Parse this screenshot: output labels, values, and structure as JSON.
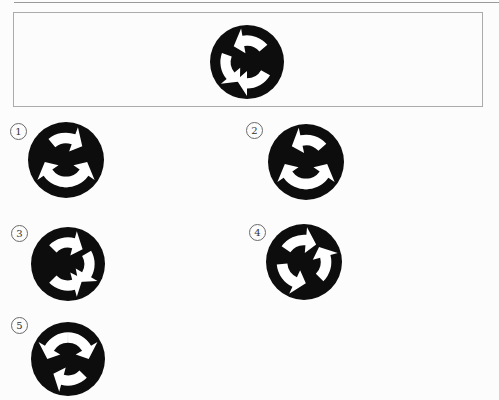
{
  "page": {
    "background": "#fcfcfc",
    "top_rule_color": "#9a9a9a",
    "question_box_border": "#ababab"
  },
  "figure_style": {
    "disc_color": "#0d0d0d",
    "arrow_color": "#ffffff"
  },
  "question": {
    "figure": {
      "diameter": 74,
      "arrows": [
        {
          "position": "top",
          "direction": "counterclockwise",
          "rotation": 10,
          "flipped": false
        },
        {
          "position": "left",
          "direction": "counterclockwise",
          "rotation": -110,
          "flipped": false
        },
        {
          "position": "bottom",
          "direction": "clockwise",
          "rotation": 160,
          "flipped": true
        }
      ]
    }
  },
  "options": [
    {
      "label": "1",
      "figure": {
        "diameter": 76,
        "arrows": [
          {
            "position": "top",
            "direction": "clockwise",
            "rotation": 0,
            "flipped": true
          },
          {
            "position": "bottom-left",
            "direction": "clockwise",
            "rotation": -145,
            "flipped": true
          },
          {
            "position": "bottom-right",
            "direction": "counterclockwise",
            "rotation": 145,
            "flipped": false
          }
        ]
      }
    },
    {
      "label": "2",
      "figure": {
        "diameter": 76,
        "arrows": [
          {
            "position": "top",
            "direction": "counterclockwise",
            "rotation": 8,
            "flipped": false
          },
          {
            "position": "bottom-left",
            "direction": "clockwise",
            "rotation": -145,
            "flipped": true
          },
          {
            "position": "bottom-right",
            "direction": "counterclockwise",
            "rotation": 145,
            "flipped": false
          }
        ]
      }
    },
    {
      "label": "3",
      "figure": {
        "diameter": 74,
        "arrows": [
          {
            "position": "top",
            "direction": "clockwise",
            "rotation": -5,
            "flipped": true
          },
          {
            "position": "right",
            "direction": "clockwise",
            "rotation": 100,
            "flipped": true
          },
          {
            "position": "bottom",
            "direction": "counterclockwise",
            "rotation": 185,
            "flipped": false
          }
        ]
      }
    },
    {
      "label": "4",
      "figure": {
        "diameter": 76,
        "arrows": [
          {
            "position": "top-left",
            "direction": "clockwise",
            "rotation": -15,
            "flipped": true
          },
          {
            "position": "right",
            "direction": "counterclockwise",
            "rotation": 95,
            "flipped": false
          },
          {
            "position": "bottom-left",
            "direction": "counterclockwise",
            "rotation": -135,
            "flipped": false
          }
        ]
      }
    },
    {
      "label": "5",
      "figure": {
        "diameter": 74,
        "arrows": [
          {
            "position": "top-left",
            "direction": "counterclockwise",
            "rotation": -40,
            "flipped": false
          },
          {
            "position": "top-right",
            "direction": "clockwise",
            "rotation": 40,
            "flipped": true
          },
          {
            "position": "bottom",
            "direction": "clockwise",
            "rotation": 175,
            "flipped": true
          }
        ]
      }
    }
  ]
}
